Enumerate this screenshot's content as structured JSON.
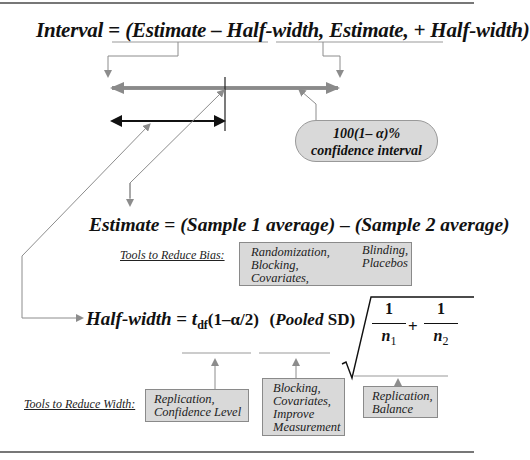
{
  "interval_formula": {
    "lhs": "Interval",
    "equals": " = ",
    "rhs_part1": "(Estimate – Half-width,",
    "rhs_part2": " Estimate, + Half-width)"
  },
  "confidence_callout": {
    "line1": "100(1– α)%",
    "line2": "confidence interval"
  },
  "estimate_formula": {
    "lhs": "Estimate",
    "equals": " = ",
    "term1": "(Sample 1 average)",
    "minus": " – ",
    "term2": "(Sample 2 average)"
  },
  "bias_tools": {
    "label": "Tools to Reduce Bias:",
    "col1": [
      "Randomization,",
      "Blocking,",
      "Covariates,"
    ],
    "col2": [
      "Blinding,",
      "Placebos"
    ]
  },
  "halfwidth_formula": {
    "lhs": "Half-width",
    "equals": " = ",
    "t": "t",
    "t_sub": "df",
    "t_arg": "(1–α/2)",
    "sd_open": "(",
    "sd_pooled": "Pooled",
    "sd_label": " SD)",
    "frac1_num": "1",
    "frac1_den": "n",
    "frac1_den_sub": "1",
    "plus": "+",
    "frac2_num": "1",
    "frac2_den": "n",
    "frac2_den_sub": "2"
  },
  "width_tools": {
    "label": "Tools to Reduce Width:",
    "box1": [
      "Replication,",
      "Confidence Level"
    ],
    "box2": [
      "Blocking,",
      "Covariates,",
      "Improve",
      "Measurement"
    ],
    "box3": [
      "Replication,",
      "Balance"
    ]
  },
  "colors": {
    "gray_arrow": "#8c8c8c",
    "interval_bar": "#8a8a8a",
    "half_bar": "#111111",
    "box_fill": "#d9d9d9"
  }
}
